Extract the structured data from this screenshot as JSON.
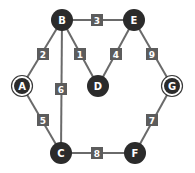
{
  "graph": {
    "nodes": [
      {
        "id": "A",
        "x": 22,
        "y": 86,
        "ring": true
      },
      {
        "id": "B",
        "x": 62,
        "y": 20,
        "ring": false
      },
      {
        "id": "C",
        "x": 61,
        "y": 153,
        "ring": false
      },
      {
        "id": "D",
        "x": 98,
        "y": 86,
        "ring": false
      },
      {
        "id": "E",
        "x": 134,
        "y": 20,
        "ring": false
      },
      {
        "id": "F",
        "x": 135,
        "y": 153,
        "ring": false
      },
      {
        "id": "G",
        "x": 172,
        "y": 86,
        "ring": true
      }
    ],
    "edges": [
      {
        "from": "B",
        "to": "E",
        "weight": "3",
        "lx": 97,
        "ly": 20
      },
      {
        "from": "A",
        "to": "B",
        "weight": "2",
        "lx": 43,
        "ly": 54
      },
      {
        "from": "B",
        "to": "D",
        "weight": "1",
        "lx": 80,
        "ly": 54
      },
      {
        "from": "E",
        "to": "D",
        "weight": "4",
        "lx": 116,
        "ly": 54
      },
      {
        "from": "E",
        "to": "G",
        "weight": "9",
        "lx": 152,
        "ly": 54
      },
      {
        "from": "B",
        "to": "C",
        "weight": "6",
        "lx": 61,
        "ly": 89
      },
      {
        "from": "A",
        "to": "C",
        "weight": "5",
        "lx": 43,
        "ly": 120
      },
      {
        "from": "G",
        "to": "F",
        "weight": "7",
        "lx": 152,
        "ly": 120
      },
      {
        "from": "C",
        "to": "F",
        "weight": "8",
        "lx": 97,
        "ly": 153
      }
    ]
  },
  "colors": {
    "node": "#2b2b2b",
    "edge": "#6a6a6a",
    "label_box": "#5c5c5c",
    "text": "#ffffff"
  }
}
